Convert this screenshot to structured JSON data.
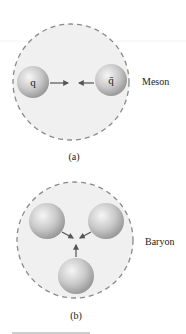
{
  "figure": {
    "panel_a": {
      "caption": "(a)",
      "label": "Meson",
      "particles": [
        {
          "symbol": "q"
        },
        {
          "symbol": "q̄"
        }
      ]
    },
    "panel_b": {
      "caption": "(b)",
      "label": "Baryon",
      "particles": [
        {
          "symbol": ""
        },
        {
          "symbol": ""
        },
        {
          "symbol": ""
        }
      ]
    },
    "colors": {
      "region_fill": "#efefef",
      "dash_stroke": "#8a8a8a",
      "sphere_light": "#f4f4f4",
      "sphere_dark": "#9a9a9a",
      "arrow": "#555555"
    }
  }
}
